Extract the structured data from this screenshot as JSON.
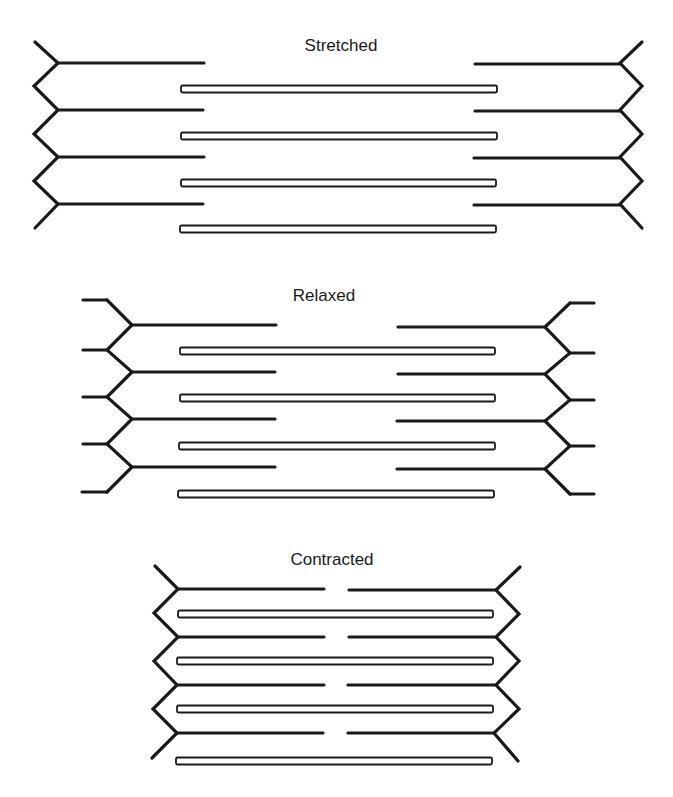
{
  "diagram": {
    "colors": {
      "stroke": "#1a1a1a",
      "thick_fill": "#ffffff",
      "background": "#ffffff"
    },
    "panels": [
      {
        "id": "stretched",
        "label": "Stretched",
        "label_pos": [
          341,
          46
        ],
        "z_line_left": {
          "vertices": [
            [
              35,
              42
            ],
            [
              58,
              63
            ],
            [
              34,
              86
            ],
            [
              58,
              110
            ],
            [
              34,
              134
            ],
            [
              58,
              157
            ],
            [
              34,
              181
            ],
            [
              58,
              204
            ],
            [
              35,
              228
            ]
          ],
          "stubs": []
        },
        "z_line_right": {
          "vertices": [
            [
              642,
              42
            ],
            [
              620,
              63
            ],
            [
              642,
              86
            ],
            [
              620,
              110
            ],
            [
              642,
              134
            ],
            [
              620,
              157
            ],
            [
              642,
              181
            ],
            [
              620,
              204
            ],
            [
              642,
              228
            ]
          ],
          "stubs": []
        },
        "thin_left": [
          {
            "y": 63,
            "x1": 58,
            "x2": 204
          },
          {
            "y": 110,
            "x1": 58,
            "x2": 203
          },
          {
            "y": 157,
            "x1": 58,
            "x2": 204
          },
          {
            "y": 204,
            "x1": 58,
            "x2": 203
          }
        ],
        "thin_right": [
          {
            "y": 64,
            "x1": 475,
            "x2": 620
          },
          {
            "y": 111,
            "x1": 475,
            "x2": 620
          },
          {
            "y": 158,
            "x1": 474,
            "x2": 620
          },
          {
            "y": 205,
            "x1": 474,
            "x2": 620
          }
        ],
        "thick": [
          {
            "y": 89,
            "x1": 181,
            "x2": 497
          },
          {
            "y": 136,
            "x1": 181,
            "x2": 497
          },
          {
            "y": 183,
            "x1": 181,
            "x2": 496
          },
          {
            "y": 229,
            "x1": 180,
            "x2": 496
          }
        ]
      },
      {
        "id": "relaxed",
        "label": "Relaxed",
        "label_pos": [
          324,
          296
        ],
        "z_line_left": {
          "vertices": [
            [
              107,
              300
            ],
            [
              132,
              325
            ],
            [
              107,
              350
            ],
            [
              132,
              372
            ],
            [
              107,
              397
            ],
            [
              132,
              419
            ],
            [
              107,
              444
            ],
            [
              132,
              467
            ],
            [
              107,
              492
            ]
          ],
          "stubs": [
            {
              "y": 300,
              "x1": 83,
              "x2": 107
            },
            {
              "y": 350,
              "x1": 83,
              "x2": 107
            },
            {
              "y": 397,
              "x1": 83,
              "x2": 107
            },
            {
              "y": 444,
              "x1": 83,
              "x2": 107
            },
            {
              "y": 492,
              "x1": 82,
              "x2": 107
            }
          ]
        },
        "z_line_right": {
          "vertices": [
            [
              570,
              303
            ],
            [
              545,
              327
            ],
            [
              570,
              353
            ],
            [
              545,
              374
            ],
            [
              570,
              400
            ],
            [
              545,
              421
            ],
            [
              570,
              446
            ],
            [
              545,
              469
            ],
            [
              570,
              494
            ]
          ],
          "stubs": [
            {
              "y": 303,
              "x1": 570,
              "x2": 594
            },
            {
              "y": 353,
              "x1": 570,
              "x2": 594
            },
            {
              "y": 400,
              "x1": 570,
              "x2": 594
            },
            {
              "y": 446,
              "x1": 570,
              "x2": 594
            },
            {
              "y": 494,
              "x1": 570,
              "x2": 594
            }
          ]
        },
        "thin_left": [
          {
            "y": 325,
            "x1": 132,
            "x2": 276
          },
          {
            "y": 372,
            "x1": 132,
            "x2": 275
          },
          {
            "y": 419,
            "x1": 132,
            "x2": 275
          },
          {
            "y": 467,
            "x1": 132,
            "x2": 275
          }
        ],
        "thin_right": [
          {
            "y": 327,
            "x1": 398,
            "x2": 545
          },
          {
            "y": 374,
            "x1": 398,
            "x2": 545
          },
          {
            "y": 421,
            "x1": 397,
            "x2": 545
          },
          {
            "y": 469,
            "x1": 397,
            "x2": 545
          }
        ],
        "thick": [
          {
            "y": 351,
            "x1": 180,
            "x2": 495
          },
          {
            "y": 398,
            "x1": 180,
            "x2": 495
          },
          {
            "y": 446,
            "x1": 179,
            "x2": 495
          },
          {
            "y": 494,
            "x1": 178,
            "x2": 494
          }
        ]
      },
      {
        "id": "contracted",
        "label": "Contracted",
        "label_pos": [
          332,
          560
        ],
        "z_line_left": {
          "vertices": [
            [
              155,
              566
            ],
            [
              178,
              589
            ],
            [
              154,
              613
            ],
            [
              178,
              637
            ],
            [
              154,
              661
            ],
            [
              177,
              685
            ],
            [
              153,
              709
            ],
            [
              177,
              733
            ],
            [
              152,
              758
            ]
          ],
          "stubs": []
        },
        "z_line_right": {
          "vertices": [
            [
              520,
              567
            ],
            [
              496,
              590
            ],
            [
              519,
              614
            ],
            [
              496,
              637
            ],
            [
              519,
              661
            ],
            [
              496,
              685
            ],
            [
              519,
              709
            ],
            [
              494,
              733
            ],
            [
              518,
              761
            ]
          ],
          "stubs": []
        },
        "thin_left": [
          {
            "y": 589,
            "x1": 178,
            "x2": 324
          },
          {
            "y": 637,
            "x1": 178,
            "x2": 324
          },
          {
            "y": 685,
            "x1": 177,
            "x2": 324
          },
          {
            "y": 733,
            "x1": 177,
            "x2": 323
          }
        ],
        "thin_right": [
          {
            "y": 590,
            "x1": 349,
            "x2": 496
          },
          {
            "y": 637,
            "x1": 349,
            "x2": 496
          },
          {
            "y": 685,
            "x1": 348,
            "x2": 496
          },
          {
            "y": 733,
            "x1": 348,
            "x2": 494
          }
        ],
        "thick": [
          {
            "y": 614,
            "x1": 178,
            "x2": 493
          },
          {
            "y": 661,
            "x1": 177,
            "x2": 493
          },
          {
            "y": 709,
            "x1": 177,
            "x2": 493
          },
          {
            "y": 761,
            "x1": 176,
            "x2": 492
          }
        ]
      }
    ],
    "legend_semantics": {
      "z_line": "zigzag-z-disc",
      "thin_filament": "solid-line-actin",
      "thick_filament": "hollow-bar-myosin"
    }
  }
}
